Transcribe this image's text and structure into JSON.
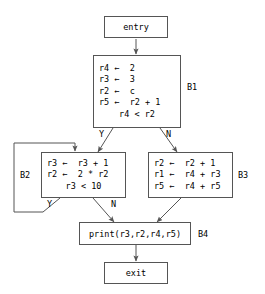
{
  "diagram": {
    "stroke_color": "#555555",
    "text_color": "#000000",
    "background_color": "#ffffff"
  },
  "nodes": {
    "entry": {
      "label": "entry",
      "block_label": ""
    },
    "b1": {
      "block_label": "B1",
      "statements": [
        "r4 ←  2",
        "r3 ←  3",
        "r2 ←  c",
        "r5 ←  r2 + 1"
      ],
      "condition": "r4 < r2"
    },
    "b2": {
      "block_label": "B2",
      "statements": [
        "r3 ←  r3 + 1",
        "r2 ←  2 * r2"
      ],
      "condition": "r3 < 10"
    },
    "b3": {
      "block_label": "B3",
      "statements": [
        "r2 ←  r2 + 1",
        "r1 ←  r4 + r3",
        "r5 ←  r4 + r5"
      ],
      "condition": ""
    },
    "b4": {
      "block_label": "B4",
      "statement": "print(r3,r2,r4,r5)"
    },
    "exit": {
      "label": "exit",
      "block_label": ""
    }
  },
  "edges": {
    "b1_yes": "Y",
    "b1_no": "N",
    "b2_yes": "Y",
    "b2_no": "N"
  }
}
